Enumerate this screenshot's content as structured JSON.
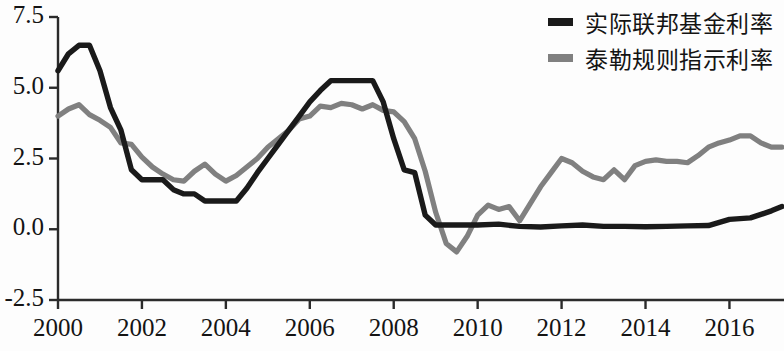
{
  "chart_data": {
    "type": "line",
    "title": "",
    "subtitle": "",
    "xlabel": "",
    "ylabel": "",
    "xlim": [
      2000,
      2017.3
    ],
    "ylim": [
      -2.5,
      7.5
    ],
    "grid": false,
    "legend_position": "top-right",
    "y_ticks": [
      "7.5",
      "5.0",
      "2.5",
      "0.0",
      "-2.5"
    ],
    "y_tick_values": [
      7.5,
      5.0,
      2.5,
      0.0,
      -2.5
    ],
    "x_ticks": [
      "2000",
      "2002",
      "2004",
      "2006",
      "2008",
      "2010",
      "2012",
      "2014",
      "2016"
    ],
    "x_tick_values": [
      2000,
      2002,
      2004,
      2006,
      2008,
      2010,
      2012,
      2014,
      2016
    ],
    "colors": {
      "series_actual": "#1a1a1a",
      "series_taylor": "#808080",
      "axis": "#2b2b2b",
      "background": "#fdfdfd",
      "text": "#141414"
    },
    "series": [
      {
        "name": "实际联邦基金利率",
        "color": "#1a1a1a",
        "x": [
          2000.0,
          2000.25,
          2000.5,
          2000.75,
          2001.0,
          2001.25,
          2001.5,
          2001.75,
          2002.0,
          2002.25,
          2002.5,
          2002.75,
          2003.0,
          2003.25,
          2003.5,
          2003.75,
          2004.0,
          2004.25,
          2004.5,
          2004.75,
          2005.0,
          2005.25,
          2005.5,
          2005.75,
          2006.0,
          2006.25,
          2006.5,
          2006.75,
          2007.0,
          2007.25,
          2007.5,
          2007.75,
          2008.0,
          2008.25,
          2008.5,
          2008.75,
          2009.0,
          2009.25,
          2009.5,
          2009.75,
          2010.0,
          2010.5,
          2011.0,
          2011.5,
          2012.0,
          2012.5,
          2013.0,
          2013.5,
          2014.0,
          2014.5,
          2015.0,
          2015.5,
          2016.0,
          2016.5,
          2017.0,
          2017.25
        ],
        "y": [
          5.6,
          6.2,
          6.5,
          6.5,
          5.6,
          4.3,
          3.5,
          2.1,
          1.75,
          1.75,
          1.75,
          1.4,
          1.25,
          1.25,
          1.0,
          1.0,
          1.0,
          1.0,
          1.45,
          2.0,
          2.5,
          3.0,
          3.5,
          4.0,
          4.5,
          4.9,
          5.25,
          5.25,
          5.25,
          5.25,
          5.25,
          4.5,
          3.2,
          2.1,
          2.0,
          0.5,
          0.15,
          0.15,
          0.15,
          0.15,
          0.15,
          0.18,
          0.1,
          0.08,
          0.12,
          0.15,
          0.1,
          0.1,
          0.09,
          0.1,
          0.12,
          0.13,
          0.35,
          0.4,
          0.65,
          0.8
        ]
      },
      {
        "name": "泰勒规则指示利率",
        "color": "#808080",
        "x": [
          2000.0,
          2000.25,
          2000.5,
          2000.75,
          2001.0,
          2001.25,
          2001.5,
          2001.75,
          2002.0,
          2002.25,
          2002.5,
          2002.75,
          2003.0,
          2003.25,
          2003.5,
          2003.75,
          2004.0,
          2004.25,
          2004.5,
          2004.75,
          2005.0,
          2005.25,
          2005.5,
          2005.75,
          2006.0,
          2006.25,
          2006.5,
          2006.75,
          2007.0,
          2007.25,
          2007.5,
          2007.75,
          2008.0,
          2008.25,
          2008.5,
          2008.75,
          2009.0,
          2009.25,
          2009.5,
          2009.75,
          2010.0,
          2010.25,
          2010.5,
          2010.75,
          2011.0,
          2011.25,
          2011.5,
          2011.75,
          2012.0,
          2012.25,
          2012.5,
          2012.75,
          2013.0,
          2013.25,
          2013.5,
          2013.75,
          2014.0,
          2014.25,
          2014.5,
          2014.75,
          2015.0,
          2015.25,
          2015.5,
          2015.75,
          2016.0,
          2016.25,
          2016.5,
          2016.75,
          2017.0,
          2017.25
        ],
        "y": [
          4.0,
          4.25,
          4.4,
          4.05,
          3.85,
          3.6,
          3.05,
          3.0,
          2.55,
          2.2,
          1.95,
          1.75,
          1.7,
          2.05,
          2.3,
          1.95,
          1.7,
          1.9,
          2.2,
          2.5,
          2.9,
          3.2,
          3.5,
          3.9,
          4.0,
          4.35,
          4.3,
          4.45,
          4.4,
          4.25,
          4.4,
          4.2,
          4.15,
          3.8,
          3.2,
          2.05,
          0.6,
          -0.5,
          -0.8,
          -0.25,
          0.5,
          0.85,
          0.7,
          0.8,
          0.3,
          0.9,
          1.5,
          2.0,
          2.5,
          2.35,
          2.05,
          1.85,
          1.75,
          2.1,
          1.75,
          2.25,
          2.4,
          2.45,
          2.4,
          2.4,
          2.35,
          2.6,
          2.9,
          3.05,
          3.15,
          3.3,
          3.3,
          3.05,
          2.9,
          2.9
        ]
      }
    ]
  },
  "legend": {
    "items": [
      {
        "label": "实际联邦基金利率",
        "color": "#1a1a1a"
      },
      {
        "label": "泰勒规则指示利率",
        "color": "#808080"
      }
    ]
  },
  "axes": {
    "y_labels": [
      "7.5",
      "5.0",
      "2.5",
      "0.0",
      "-2.5"
    ],
    "x_labels": [
      "2000",
      "2002",
      "2004",
      "2006",
      "2008",
      "2010",
      "2012",
      "2014",
      "2016"
    ]
  }
}
